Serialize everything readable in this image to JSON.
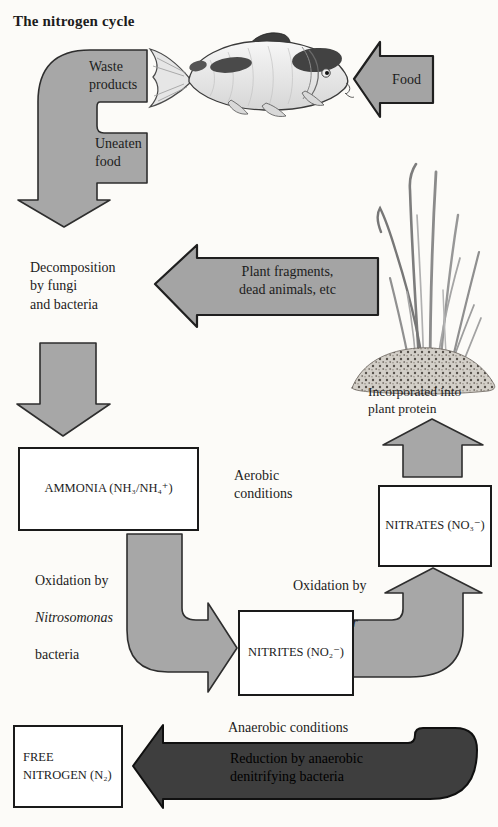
{
  "title": "The nitrogen cycle",
  "colors": {
    "background": "#fcfbf8",
    "arrow_gray": "#a7a7a7",
    "arrow_dark": "#3e3e3e",
    "outline": "#1a1a1a",
    "text": "#1c1c1c"
  },
  "labels": {
    "waste_products": "Waste\nproducts",
    "uneaten_food": "Uneaten\nfood",
    "food": "Food",
    "decomposition": "Decomposition\nby fungi\nand bacteria",
    "plant_fragments": "Plant fragments,\ndead animals, etc",
    "incorporated": "Incorporated into\nplant protein",
    "aerobic": "Aerobic\nconditions",
    "anaerobic": "Anaerobic conditions",
    "reduction": "Reduction by anaerobic\ndenitrifying bacteria",
    "oxidation_left": {
      "line1": "Oxidation by",
      "organism": "Nitrosomonas",
      "line3": "bacteria"
    },
    "oxidation_right": {
      "line1": "Oxidation by",
      "organism": "Nitrobacter",
      "line3": "bacteria"
    }
  },
  "boxes": {
    "ammonia": "AMMONIA (NH₃/NH₄⁺)",
    "nitrites": "NITRITES (NO₂⁻)",
    "nitrates": "NITRATES (NO₃⁻)",
    "free_nitrogen": "FREE\nNITROGEN (N₂)"
  },
  "illustrations": {
    "fish": "koi-carp-fish-illustration",
    "plant": "aquatic-grass-plant-illustration"
  }
}
